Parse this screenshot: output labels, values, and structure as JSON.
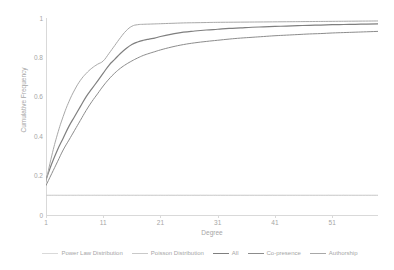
{
  "chart_data": {
    "type": "line",
    "title": "",
    "xlabel": "Degree",
    "ylabel": "Cumulative Frequency",
    "xlim": [
      1,
      59
    ],
    "ylim": [
      0,
      1
    ],
    "grid": false,
    "legend_position": "bottom",
    "xticks": [
      "1",
      "11",
      "21",
      "31",
      "41",
      "51"
    ],
    "xtick_values": [
      1,
      11,
      21,
      31,
      41,
      51
    ],
    "yticks": [
      "0",
      "0.2",
      "0.4",
      "0.6",
      "0.8",
      "1"
    ],
    "ytick_values": [
      0,
      0.2,
      0.4,
      0.6,
      0.8,
      1
    ],
    "series": [
      {
        "name": "Power Law Distribution",
        "color": "#d9d9d9",
        "width": 0.8,
        "x": [
          1,
          2,
          3,
          4,
          5,
          6,
          7,
          8,
          9,
          10,
          11,
          12,
          13,
          14,
          15,
          16,
          17,
          18,
          19,
          20,
          21,
          23,
          25,
          27,
          29,
          31,
          35,
          39,
          43,
          47,
          51,
          55,
          59
        ],
        "y": [
          0.1,
          0.1,
          0.1,
          0.1,
          0.1,
          0.1,
          0.1,
          0.1,
          0.1,
          0.1,
          0.1,
          0.1,
          0.1,
          0.1,
          0.1,
          0.1,
          0.1,
          0.1,
          0.1,
          0.1,
          0.1,
          0.1,
          0.1,
          0.1,
          0.1,
          0.1,
          0.1,
          0.1,
          0.1,
          0.1,
          0.1,
          0.1,
          0.1
        ]
      },
      {
        "name": "Poisson Distribution",
        "color": "#c9c9c9",
        "width": 0.8,
        "x": [
          1,
          2,
          3,
          4,
          5,
          6,
          7,
          8,
          9,
          10,
          11,
          12,
          13,
          14,
          15,
          16,
          17,
          18,
          19,
          20,
          21,
          23,
          25,
          27,
          29,
          31,
          35,
          39,
          43,
          47,
          51,
          55,
          59
        ],
        "y": [
          0.1,
          0.1,
          0.1,
          0.1,
          0.1,
          0.1,
          0.1,
          0.1,
          0.1,
          0.1,
          0.1,
          0.1,
          0.1,
          0.1,
          0.1,
          0.1,
          0.1,
          0.1,
          0.1,
          0.1,
          0.1,
          0.1,
          0.1,
          0.1,
          0.1,
          0.1,
          0.1,
          0.1,
          0.1,
          0.1,
          0.1,
          0.1,
          0.1
        ]
      },
      {
        "name": "All",
        "color": "#7f7f7f",
        "width": 1.2,
        "x": [
          1,
          2,
          3,
          4,
          5,
          6,
          7,
          8,
          9,
          10,
          11,
          12,
          13,
          14,
          15,
          16,
          17,
          18,
          19,
          20,
          21,
          23,
          25,
          27,
          29,
          31,
          33,
          35,
          37,
          39,
          41,
          43,
          45,
          47,
          49,
          51,
          53,
          55,
          57,
          59
        ],
        "y": [
          0.18,
          0.26,
          0.33,
          0.39,
          0.45,
          0.5,
          0.55,
          0.6,
          0.64,
          0.68,
          0.72,
          0.76,
          0.79,
          0.82,
          0.845,
          0.865,
          0.878,
          0.887,
          0.893,
          0.898,
          0.906,
          0.918,
          0.928,
          0.934,
          0.939,
          0.943,
          0.947,
          0.95,
          0.953,
          0.955,
          0.957,
          0.959,
          0.961,
          0.963,
          0.964,
          0.966,
          0.967,
          0.968,
          0.969,
          0.97
        ]
      },
      {
        "name": "Co-presence",
        "color": "#8c8c8c",
        "width": 1.0,
        "x": [
          1,
          2,
          3,
          4,
          5,
          6,
          7,
          8,
          9,
          10,
          11,
          12,
          13,
          14,
          15,
          16,
          17,
          18,
          19,
          20,
          21,
          23,
          25,
          27,
          29,
          31,
          33,
          35,
          37,
          39,
          41,
          43,
          45,
          47,
          49,
          51,
          53,
          55,
          57,
          59
        ],
        "y": [
          0.15,
          0.21,
          0.27,
          0.33,
          0.38,
          0.43,
          0.48,
          0.53,
          0.575,
          0.615,
          0.655,
          0.69,
          0.72,
          0.745,
          0.765,
          0.782,
          0.797,
          0.81,
          0.82,
          0.829,
          0.838,
          0.853,
          0.865,
          0.874,
          0.881,
          0.887,
          0.893,
          0.898,
          0.902,
          0.906,
          0.91,
          0.913,
          0.916,
          0.919,
          0.921,
          0.924,
          0.926,
          0.928,
          0.93,
          0.932
        ]
      },
      {
        "name": "Authorship",
        "color": "#a8a8a8",
        "width": 1.0,
        "x": [
          1,
          2,
          3,
          4,
          5,
          6,
          7,
          8,
          9,
          10,
          11,
          12,
          13,
          14,
          15,
          16,
          17,
          18,
          19,
          20,
          21,
          23,
          25,
          27,
          29,
          31,
          35,
          39,
          43,
          47,
          51,
          55,
          59
        ],
        "y": [
          0.17,
          0.3,
          0.41,
          0.5,
          0.575,
          0.635,
          0.683,
          0.718,
          0.745,
          0.765,
          0.782,
          0.82,
          0.86,
          0.9,
          0.935,
          0.958,
          0.966,
          0.968,
          0.969,
          0.97,
          0.971,
          0.973,
          0.975,
          0.976,
          0.977,
          0.978,
          0.979,
          0.98,
          0.981,
          0.982,
          0.983,
          0.984,
          0.985
        ]
      }
    ]
  },
  "legend": {
    "entries": [
      {
        "label": "Power Law Distribution",
        "color": "#d9d9d9"
      },
      {
        "label": "Poisson Distribution",
        "color": "#c9c9c9"
      },
      {
        "label": "All",
        "color": "#7f7f7f"
      },
      {
        "label": "Co-presence",
        "color": "#8c8c8c"
      },
      {
        "label": "Authorship",
        "color": "#a8a8a8"
      }
    ]
  },
  "axes": {
    "x_title": "Degree",
    "y_title": "Cumulative Frequency"
  }
}
